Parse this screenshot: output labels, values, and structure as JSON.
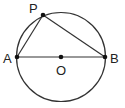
{
  "diagram": {
    "title": "",
    "circle": {
      "center_label": "O",
      "cx": 61,
      "cy": 57,
      "r": 44.5
    },
    "points": [
      {
        "name": "P",
        "x": 43,
        "y": 15,
        "label_x": 29,
        "label_y": 12
      },
      {
        "name": "A",
        "x": 17,
        "y": 57,
        "label_x": 3,
        "label_y": 63
      },
      {
        "name": "O",
        "x": 61,
        "y": 57,
        "label_x": 56,
        "label_y": 75
      },
      {
        "name": "B",
        "x": 105,
        "y": 57,
        "label_x": 110,
        "label_y": 63
      }
    ],
    "segments": [
      [
        "A",
        "B"
      ],
      [
        "A",
        "P"
      ],
      [
        "P",
        "B"
      ]
    ],
    "colors": {
      "stroke": "#333333",
      "text": "#222222"
    }
  }
}
